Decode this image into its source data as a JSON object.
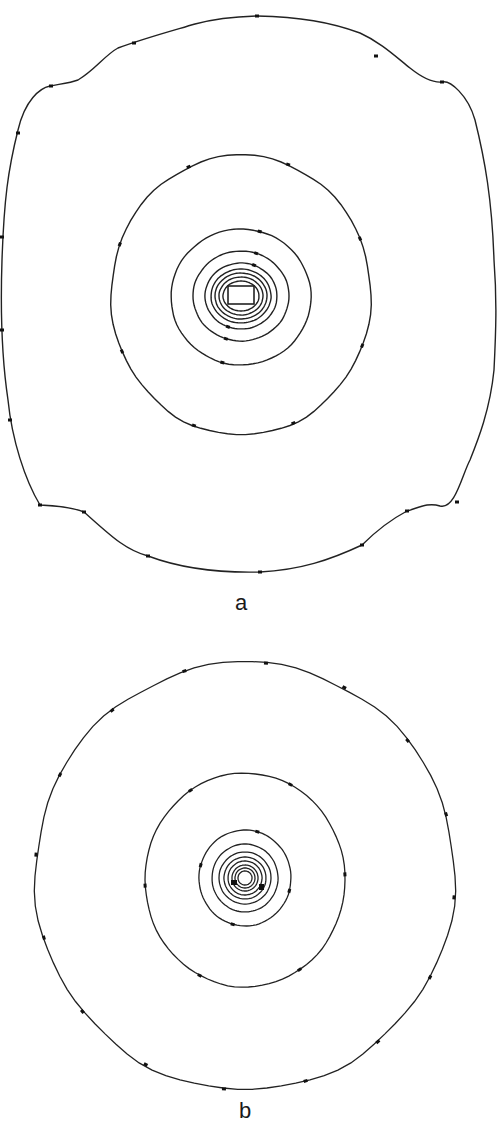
{
  "figure": {
    "panels": [
      {
        "label": "a",
        "center": [
          241,
          295
        ],
        "description": "Contour map around a rectangular source; outer contour irregular, roughly square with lobes",
        "outer_contour_path": "M 257,16 C 300,17 330,22 360,33 C 380,42 395,56 410,68 C 420,76 432,83 442,82 C 450,80 468,95 475,120 C 485,160 492,200 494,260 C 497,300 496,330 494,370 C 490,410 478,440 470,460 C 462,475 455,510 440,506 C 428,502 418,508 407,511 C 390,520 372,535 362,545 C 330,560 300,570 260,572 C 220,573 180,568 148,556 C 125,550 110,535 84,512 C 74,508 62,506 40,505 C 25,480 12,440 8,400 C 2,360 0,320 2,260 C 4,200 8,170 18,130 C 25,100 40,88 50,86 C 60,84 70,83 78,80 C 95,70 105,55 118,48 C 145,38 175,30 195,24 C 210,20 225,17 257,16 Z",
        "rings": [
          {
            "rx": 130,
            "ry": 140,
            "dy": 0
          },
          {
            "rx": 70,
            "ry": 68,
            "dy": 2
          },
          {
            "rx": 48,
            "ry": 45,
            "dy": 1
          },
          {
            "rx": 36,
            "ry": 33,
            "dy": 1
          },
          {
            "rx": 30,
            "ry": 27,
            "dy": 1
          },
          {
            "rx": 26,
            "ry": 23,
            "dy": 1
          },
          {
            "rx": 22,
            "ry": 19,
            "dy": 1
          },
          {
            "rx": 18,
            "ry": 15,
            "dy": 1
          }
        ],
        "source_rect": {
          "w": 26,
          "h": 18
        }
      },
      {
        "label": "b",
        "center": [
          245,
          878
        ],
        "description": "Near-circular concentric contour map around a point source",
        "rings": [
          {
            "rx": 210,
            "ry": 214,
            "dy": -2
          },
          {
            "rx": 100,
            "ry": 107,
            "dy": 2
          },
          {
            "rx": 46,
            "ry": 48,
            "dy": 0
          },
          {
            "rx": 33,
            "ry": 34,
            "dy": 0
          },
          {
            "rx": 26,
            "ry": 26,
            "dy": 0
          },
          {
            "rx": 21,
            "ry": 21,
            "dy": 0
          },
          {
            "rx": 17,
            "ry": 17,
            "dy": 0
          },
          {
            "rx": 13,
            "ry": 13,
            "dy": 0
          },
          {
            "rx": 10,
            "ry": 10,
            "dy": 0
          },
          {
            "rx": 7,
            "ry": 7,
            "dy": 0
          }
        ]
      }
    ],
    "colors": {
      "line": "#222222",
      "background": "#ffffff",
      "marker": "#111111"
    }
  }
}
